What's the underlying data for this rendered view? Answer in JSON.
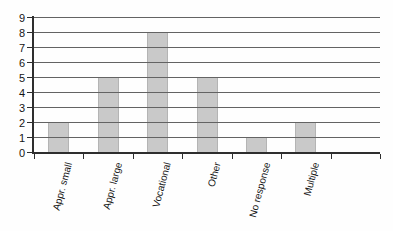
{
  "chart_data": {
    "type": "bar",
    "title": "",
    "xlabel": "",
    "ylabel": "",
    "categories": [
      "Appr. small",
      "Appr. large",
      "Vocational",
      "Other",
      "No response",
      "Multiple",
      ""
    ],
    "values": [
      2,
      5,
      8,
      5,
      1,
      2,
      null
    ],
    "ylim": [
      0,
      9
    ],
    "yticks": [
      0,
      1,
      2,
      3,
      4,
      5,
      6,
      7,
      8,
      9
    ],
    "grid": true,
    "gridlines_over_bars": true,
    "legend": false,
    "bar_color": "#c9c9c9",
    "bar_edge_color": "#b4b4b4",
    "gridline_color": "#636363",
    "axis_color": "#2e2e2e",
    "text_color": "#141414",
    "background_color": "#fefefe"
  }
}
